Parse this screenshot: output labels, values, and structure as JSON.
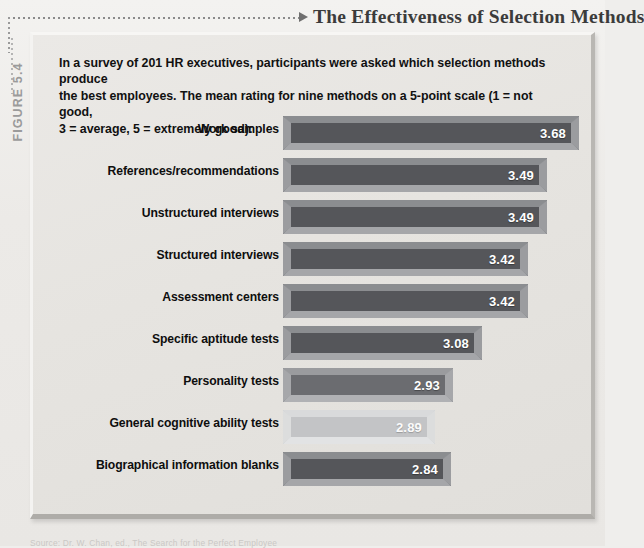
{
  "figure": {
    "number_label": "FIGURE 5.4",
    "title": "The Effectiveness of Selection Methods",
    "arrow_icon": "leader-arrow-icon"
  },
  "intro": {
    "line1": "In a survey of 201 HR executives, participants were asked which selection methods produce",
    "line2": "the best  employees. The mean rating for nine methods on a 5-point scale (1 = not good,",
    "line3": "3 = average, 5 = extremely good):"
  },
  "source": {
    "text": "Source: Dr. W. Chan, ed., The Search for the Perfect Employee"
  },
  "colors": {
    "bar_face_dark": "#55565a",
    "bar_face_mid": "#6b6c70",
    "bar_face_light": "#c3c4c6",
    "bar_bevel_top": "#8e9093",
    "bar_bevel_bottom": "#a9aaad",
    "panel_bg": "#e8e6e3",
    "page_bg": "#efeeec",
    "value_text": "#ffffff",
    "title_text": "#3b3b3b"
  },
  "chart_data": {
    "type": "bar",
    "orientation": "horizontal",
    "title": "The Effectiveness of Selection Methods",
    "xlabel": "",
    "ylabel": "",
    "xlim": [
      0,
      4
    ],
    "grid": false,
    "legend": "none",
    "scale_note": "5-point scale (1 = not good, 3 = average, 5 = extremely good)",
    "sample_size": 201,
    "categories": [
      "Work samples",
      "References/recommendations",
      "Unstructured interviews",
      "Structured interviews",
      "Assessment centers",
      "Specific aptitude tests",
      "Personality tests",
      "General cognitive ability tests",
      "Biographical information blanks"
    ],
    "values": [
      3.68,
      3.49,
      3.49,
      3.42,
      3.42,
      3.08,
      2.93,
      2.89,
      2.84
    ],
    "value_labels": [
      "3.68",
      "3.49",
      "3.49",
      "3.42",
      "3.42",
      "3.08",
      "2.93",
      "2.89",
      "2.84"
    ],
    "bar_pixel_widths": [
      296,
      264,
      264,
      245,
      245,
      199,
      170,
      152,
      168
    ],
    "bar_shades": [
      "dark",
      "dark",
      "dark",
      "dark",
      "dark",
      "dark",
      "mid",
      "light",
      "dark"
    ]
  }
}
